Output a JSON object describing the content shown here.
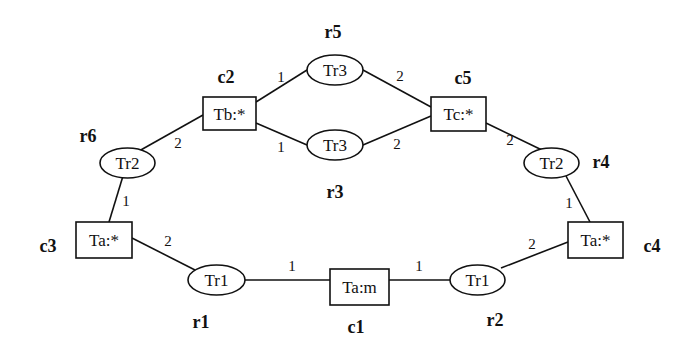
{
  "diagram": {
    "nodes": {
      "c1": {
        "id": "c1",
        "shape": "rect",
        "label": "Ta:m"
      },
      "c2": {
        "id": "c2",
        "shape": "rect",
        "label": "Tb:*"
      },
      "c3": {
        "id": "c3",
        "shape": "rect",
        "label": "Ta:*"
      },
      "c4": {
        "id": "c4",
        "shape": "rect",
        "label": "Ta:*"
      },
      "c5": {
        "id": "c5",
        "shape": "rect",
        "label": "Tc:*"
      },
      "r1": {
        "id": "r1",
        "shape": "ellipse",
        "label": "Tr1"
      },
      "r2": {
        "id": "r2",
        "shape": "ellipse",
        "label": "Tr1"
      },
      "r3": {
        "id": "r3",
        "shape": "ellipse",
        "label": "Tr3"
      },
      "r4": {
        "id": "r4",
        "shape": "ellipse",
        "label": "Tr2"
      },
      "r5": {
        "id": "r5",
        "shape": "ellipse",
        "label": "Tr3"
      },
      "r6": {
        "id": "r6",
        "shape": "ellipse",
        "label": "Tr2"
      }
    },
    "edges": [
      {
        "from": "r1",
        "to": "c1",
        "port": "1"
      },
      {
        "from": "r2",
        "to": "c1",
        "port": "1"
      },
      {
        "from": "r1",
        "to": "c3",
        "port": "2"
      },
      {
        "from": "r6",
        "to": "c3",
        "port": "1"
      },
      {
        "from": "r6",
        "to": "c2",
        "port": "2"
      },
      {
        "from": "r5",
        "to": "c2",
        "port": "1"
      },
      {
        "from": "r3",
        "to": "c2",
        "port": "1"
      },
      {
        "from": "r5",
        "to": "c5",
        "port": "2"
      },
      {
        "from": "r3",
        "to": "c5",
        "port": "2"
      },
      {
        "from": "r4",
        "to": "c5",
        "port": "2"
      },
      {
        "from": "r4",
        "to": "c4",
        "port": "1"
      },
      {
        "from": "r2",
        "to": "c4",
        "port": "2"
      }
    ]
  }
}
